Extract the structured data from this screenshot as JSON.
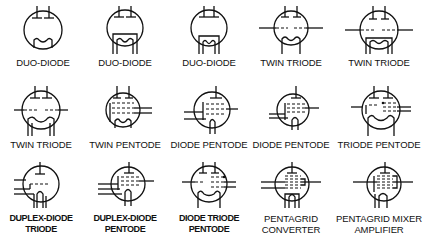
{
  "rows": [
    {
      "symbols": [
        {
          "name": "duo-diode-1",
          "label": [
            "DUO-DIODE"
          ],
          "bold": false
        },
        {
          "name": "duo-diode-2",
          "label": [
            "DUO-DIODE"
          ],
          "bold": false
        },
        {
          "name": "duo-diode-3",
          "label": [
            "DUO-DIODE"
          ],
          "bold": false
        },
        {
          "name": "twin-triode-1",
          "label": [
            "TWIN TRIODE"
          ],
          "bold": false
        },
        {
          "name": "twin-triode-2",
          "label": [
            "TWIN TRIODE"
          ],
          "bold": false
        }
      ]
    },
    {
      "symbols": [
        {
          "name": "twin-triode-3",
          "label": [
            "TWIN TRIODE"
          ],
          "bold": false
        },
        {
          "name": "twin-pentode",
          "label": [
            "TWIN PENTODE"
          ],
          "bold": false
        },
        {
          "name": "diode-pentode-1",
          "label": [
            "DIODE PENTODE"
          ],
          "bold": false
        },
        {
          "name": "diode-pentode-2",
          "label": [
            "DIODE PENTODE"
          ],
          "bold": false
        },
        {
          "name": "triode-pentode",
          "label": [
            "TRIODE PENTODE"
          ],
          "bold": false
        }
      ]
    },
    {
      "symbols": [
        {
          "name": "duplex-diode-triode",
          "label": [
            "DUPLEX-DIODE",
            "TRIODE"
          ],
          "bold": true
        },
        {
          "name": "duplex-diode-pentode",
          "label": [
            "DUPLEX-DIODE",
            "PENTODE"
          ],
          "bold": true
        },
        {
          "name": "diode-triode-pentode",
          "label": [
            "DIODE TRIODE",
            "PENTODE"
          ],
          "bold": true
        },
        {
          "name": "pentagrid-converter",
          "label": [
            "PENTAGRID",
            "CONVERTER"
          ],
          "bold": false
        },
        {
          "name": "pentagrid-mixer-amplifier",
          "label": [
            "PENTAGRID MIXER",
            "AMPLIFIER"
          ],
          "bold": false
        }
      ]
    }
  ]
}
